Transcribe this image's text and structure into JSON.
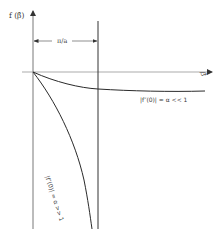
{
  "figure": {
    "y_axis_label": "f (β̂)",
    "x_axis_label": "β̂",
    "dimension_label": "π/a",
    "curves": [
      {
        "name": "small-alpha-curve",
        "label": "|f″(0)| = α << 1"
      },
      {
        "name": "large-alpha-curve",
        "label": "|f″(0)| = α >> 1"
      }
    ],
    "colors": {
      "line": "#2a2a2a",
      "axis": "#555555"
    }
  }
}
